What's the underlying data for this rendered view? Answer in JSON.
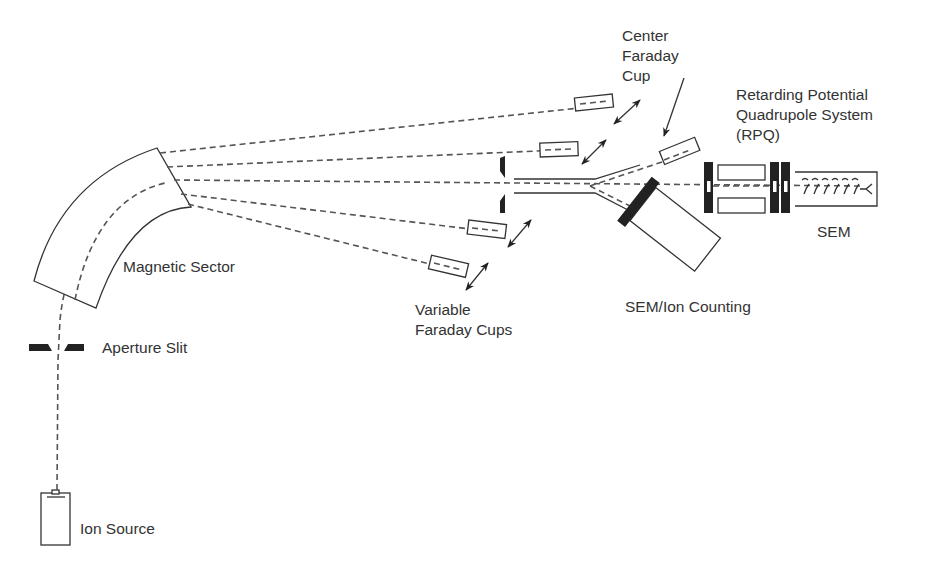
{
  "labels": {
    "ion_source": "Ion Source",
    "aperture_slit": "Aperture Slit",
    "magnetic_sector": "Magnetic Sector",
    "variable_faraday_cups": [
      "Variable",
      "Faraday Cups"
    ],
    "center_faraday_cup": [
      "Center",
      "Faraday",
      "Cup"
    ],
    "sem_ion_counting": "SEM/Ion Counting",
    "rpq": [
      "Retarding Potential",
      "Quadrupole System",
      "(RPQ)"
    ],
    "sem": "SEM"
  },
  "components": [
    {
      "id": "ion-source",
      "label": "Ion Source"
    },
    {
      "id": "aperture-slit",
      "label": "Aperture Slit"
    },
    {
      "id": "magnetic-sector",
      "label": "Magnetic Sector"
    },
    {
      "id": "variable-faraday-cups",
      "label": "Variable Faraday Cups",
      "count": 4
    },
    {
      "id": "center-faraday-cup",
      "label": "Center Faraday Cup"
    },
    {
      "id": "sem-ion-counting",
      "label": "SEM/Ion Counting"
    },
    {
      "id": "rpq",
      "label": "Retarding Potential Quadrupole System (RPQ)"
    },
    {
      "id": "sem",
      "label": "SEM"
    }
  ],
  "colors": {
    "ink": "#333333",
    "beam": "#555555",
    "solid": "#222222",
    "background": "#ffffff"
  }
}
